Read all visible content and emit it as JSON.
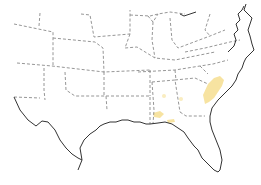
{
  "map": {
    "region": "Southeastern United States",
    "background": "#ffffff",
    "colors": {
      "state_border": "#8a8a8a",
      "coastline": "#333333",
      "abnormally_dry": "#f7e3a1"
    },
    "highlighted_areas": [
      {
        "name": "south-carolina-georgia-coast",
        "category": "abnormally_dry"
      },
      {
        "name": "alabama-south",
        "category": "abnormally_dry"
      },
      {
        "name": "alabama-georgia-border-spot",
        "category": "abnormally_dry"
      },
      {
        "name": "alabama-central-spot",
        "category": "abnormally_dry"
      },
      {
        "name": "georgia-central-spot",
        "category": "abnormally_dry"
      }
    ]
  }
}
